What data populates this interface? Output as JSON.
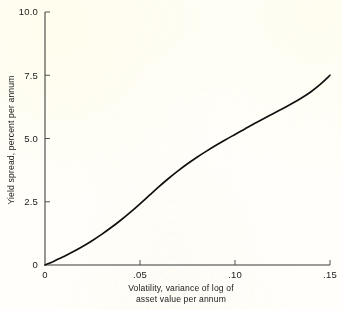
{
  "chart_data": {
    "type": "line",
    "title": "",
    "subtitle": "",
    "xlabel_line1": "Volatility, variance of log of",
    "xlabel_line2": "asset value per annum",
    "ylabel": "Yield spread, percent per annum",
    "xlim": [
      0,
      0.15
    ],
    "ylim": [
      0,
      10.0
    ],
    "grid": false,
    "legend": false,
    "legend_position": "none",
    "x_ticks": [
      0,
      0.05,
      0.1,
      0.15
    ],
    "x_tick_labels": [
      "0",
      ".05",
      ".10",
      ".15"
    ],
    "y_ticks": [
      0,
      2.5,
      5.0,
      7.5,
      10.0
    ],
    "y_tick_labels": [
      "0",
      "2.5",
      "5.0",
      "7.5",
      "10.0"
    ],
    "series": [
      {
        "name": "yield spread",
        "x": [
          0.0,
          0.005,
          0.01,
          0.015,
          0.02,
          0.025,
          0.03,
          0.035,
          0.04,
          0.045,
          0.05,
          0.055,
          0.06,
          0.065,
          0.07,
          0.075,
          0.08,
          0.085,
          0.09,
          0.095,
          0.1,
          0.105,
          0.11,
          0.115,
          0.12,
          0.125,
          0.13,
          0.135,
          0.14,
          0.145,
          0.15
        ],
        "values": [
          0.0,
          0.16,
          0.34,
          0.53,
          0.74,
          0.97,
          1.22,
          1.49,
          1.78,
          2.09,
          2.42,
          2.76,
          3.1,
          3.42,
          3.72,
          4.0,
          4.26,
          4.5,
          4.73,
          4.95,
          5.16,
          5.37,
          5.58,
          5.78,
          5.98,
          6.18,
          6.38,
          6.6,
          6.85,
          7.15,
          7.5
        ]
      }
    ],
    "annotations": []
  },
  "geometry": {
    "plot_left": 45,
    "plot_right": 330,
    "plot_top": 12,
    "plot_bottom": 265,
    "tick_length": 5
  },
  "colors": {
    "background": "#fffefa",
    "axis": "#3a3a3a",
    "curve": "#101010",
    "text": "#1a1a1a"
  }
}
